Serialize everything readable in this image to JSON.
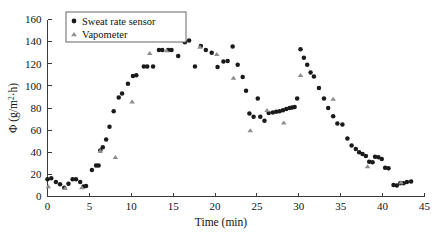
{
  "chart_data": {
    "type": "scatter",
    "title": "",
    "xlabel": "Time (min)",
    "ylabel": "Φ (g/m²·h)",
    "ylabel_base": "Φ (g/m",
    "ylabel_sup": "2",
    "ylabel_tail": "·h)",
    "xlim": [
      0,
      45
    ],
    "ylim": [
      0,
      160
    ],
    "xticks": [
      0,
      5,
      10,
      15,
      20,
      25,
      30,
      35,
      40,
      45
    ],
    "yticks": [
      0,
      20,
      40,
      60,
      80,
      100,
      120,
      140,
      160
    ],
    "xtick_labels": [
      "0",
      "5",
      "10",
      "15",
      "20",
      "25",
      "30",
      "35",
      "40",
      "45"
    ],
    "ytick_labels": [
      "0",
      "20",
      "40",
      "60",
      "80",
      "100",
      "120",
      "140",
      "160"
    ],
    "grid": false,
    "legend_position": "top-left",
    "series": [
      {
        "name": "Sweat rate sensor",
        "marker": "circle",
        "color": "#1a1a1a",
        "points": [
          [
            0.0,
            15.5
          ],
          [
            0.45,
            16.5
          ],
          [
            1.0,
            13.0
          ],
          [
            1.5,
            11.0
          ],
          [
            2.0,
            8.0
          ],
          [
            2.5,
            11.5
          ],
          [
            3.0,
            15.5
          ],
          [
            3.4,
            15.5
          ],
          [
            3.9,
            13.0
          ],
          [
            4.3,
            9.0
          ],
          [
            4.6,
            9.5
          ],
          [
            5.3,
            24.0
          ],
          [
            5.8,
            28.0
          ],
          [
            6.1,
            28.0
          ],
          [
            6.3,
            41.5
          ],
          [
            6.6,
            44.5
          ],
          [
            7.0,
            51.5
          ],
          [
            7.4,
            63.0
          ],
          [
            7.9,
            77.0
          ],
          [
            8.5,
            89.5
          ],
          [
            8.9,
            93.0
          ],
          [
            9.6,
            102.0
          ],
          [
            10.2,
            109.0
          ],
          [
            10.6,
            109.5
          ],
          [
            11.5,
            117.5
          ],
          [
            11.9,
            117.5
          ],
          [
            12.6,
            117.5
          ],
          [
            13.3,
            132.5
          ],
          [
            13.7,
            132.5
          ],
          [
            14.4,
            132.5
          ],
          [
            14.8,
            132.5
          ],
          [
            15.6,
            127.0
          ],
          [
            16.4,
            139.5
          ],
          [
            16.9,
            141.0
          ],
          [
            17.6,
            117.5
          ],
          [
            18.3,
            136.0
          ],
          [
            18.9,
            132.5
          ],
          [
            19.6,
            130.0
          ],
          [
            20.3,
            117.0
          ],
          [
            21.0,
            122.0
          ],
          [
            21.5,
            122.5
          ],
          [
            22.1,
            135.5
          ],
          [
            22.7,
            119.0
          ],
          [
            23.3,
            108.0
          ],
          [
            23.7,
            95.5
          ],
          [
            24.1,
            75.0
          ],
          [
            24.6,
            72.0
          ],
          [
            25.1,
            88.5
          ],
          [
            25.4,
            72.0
          ],
          [
            25.9,
            68.5
          ],
          [
            26.4,
            75.5
          ],
          [
            26.9,
            76.0
          ],
          [
            27.3,
            76.5
          ],
          [
            27.7,
            77.0
          ],
          [
            28.1,
            78.0
          ],
          [
            28.5,
            79.0
          ],
          [
            28.9,
            80.0
          ],
          [
            29.2,
            80.5
          ],
          [
            29.5,
            81.0
          ],
          [
            29.8,
            88.5
          ],
          [
            30.2,
            133.0
          ],
          [
            30.6,
            125.5
          ],
          [
            31.0,
            119.0
          ],
          [
            31.4,
            112.0
          ],
          [
            31.8,
            108.5
          ],
          [
            32.4,
            98.0
          ],
          [
            33.0,
            88.5
          ],
          [
            33.5,
            80.0
          ],
          [
            34.1,
            72.5
          ],
          [
            34.6,
            66.0
          ],
          [
            35.2,
            65.0
          ],
          [
            35.8,
            52.5
          ],
          [
            36.3,
            46.0
          ],
          [
            36.8,
            43.0
          ],
          [
            37.2,
            40.0
          ],
          [
            37.6,
            38.5
          ],
          [
            38.0,
            36.5
          ],
          [
            38.4,
            31.5
          ],
          [
            38.8,
            31.0
          ],
          [
            39.1,
            36.0
          ],
          [
            39.5,
            35.5
          ],
          [
            39.9,
            34.0
          ],
          [
            40.3,
            26.0
          ],
          [
            40.7,
            25.5
          ],
          [
            41.3,
            10.5
          ],
          [
            41.7,
            10.0
          ],
          [
            42.1,
            12.0
          ],
          [
            42.5,
            12.0
          ],
          [
            42.9,
            13.0
          ],
          [
            43.4,
            13.5
          ]
        ]
      },
      {
        "name": "Vapometer",
        "marker": "triangle",
        "color": "#8e8e8e",
        "points": [
          [
            0.1,
            9.0
          ],
          [
            2.1,
            7.5
          ],
          [
            4.1,
            8.0
          ],
          [
            6.3,
            41.0
          ],
          [
            8.1,
            35.5
          ],
          [
            10.1,
            85.5
          ],
          [
            12.2,
            129.5
          ],
          [
            14.2,
            132.0
          ],
          [
            16.2,
            141.0
          ],
          [
            18.2,
            135.0
          ],
          [
            20.2,
            128.5
          ],
          [
            22.2,
            107.0
          ],
          [
            24.2,
            59.5
          ],
          [
            26.2,
            78.0
          ],
          [
            28.2,
            66.5
          ],
          [
            30.2,
            109.5
          ],
          [
            34.1,
            88.0
          ],
          [
            38.2,
            27.0
          ],
          [
            42.2,
            12.5
          ]
        ]
      }
    ]
  },
  "legend": {
    "items": [
      {
        "label": "Sweat rate sensor",
        "marker": "circle"
      },
      {
        "label": "Vapometer",
        "marker": "triangle"
      }
    ]
  },
  "colors": {
    "sweat_sensor": "#1a1a1a",
    "vapometer": "#8e8e8e",
    "axis": "#3a3a3a",
    "background": "#ffffff"
  }
}
